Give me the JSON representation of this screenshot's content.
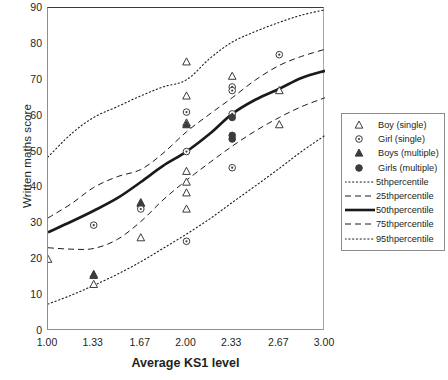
{
  "chart_data": {
    "type": "scatter",
    "title": "",
    "xlabel": "Average KS1 level",
    "ylabel": "Written maths score",
    "xlim": [
      1.0,
      3.0
    ],
    "ylim": [
      0,
      90
    ],
    "grid": false,
    "legend_position": "right",
    "xticks": [
      "1.00",
      "1.33",
      "1.67",
      "2.00",
      "2.33",
      "2.67",
      "3.00"
    ],
    "xtick_values": [
      1.0,
      1.33,
      1.67,
      2.0,
      2.33,
      2.67,
      3.0
    ],
    "yticks": [
      "0",
      "10",
      "20",
      "30",
      "40",
      "50",
      "60",
      "70",
      "80",
      "90"
    ],
    "ytick_values": [
      0,
      10,
      20,
      30,
      40,
      50,
      60,
      70,
      80,
      90
    ],
    "series": [
      {
        "name": "Boy (single)",
        "marker": "open-triangle",
        "points": [
          [
            1.0,
            20
          ],
          [
            1.33,
            15.5
          ],
          [
            1.33,
            13
          ],
          [
            1.67,
            35.5
          ],
          [
            1.67,
            26
          ],
          [
            2.0,
            75
          ],
          [
            2.0,
            65.5
          ],
          [
            2.0,
            58
          ],
          [
            2.0,
            44.5
          ],
          [
            2.0,
            41.5
          ],
          [
            2.0,
            38.5
          ],
          [
            2.0,
            34
          ],
          [
            2.33,
            71
          ],
          [
            2.67,
            67
          ],
          [
            2.67,
            57.5
          ]
        ]
      },
      {
        "name": "Girl (single)",
        "marker": "open-circle-dot",
        "points": [
          [
            1.33,
            29.5
          ],
          [
            1.67,
            34
          ],
          [
            2.0,
            61
          ],
          [
            2.0,
            50
          ],
          [
            2.0,
            25
          ],
          [
            2.33,
            68
          ],
          [
            2.33,
            67
          ],
          [
            2.33,
            60.5
          ],
          [
            2.33,
            45.5
          ],
          [
            2.67,
            77
          ]
        ]
      },
      {
        "name": "Boys (multiple)",
        "marker": "filled-triangle",
        "points": [
          [
            1.33,
            15.8
          ],
          [
            1.67,
            35.8
          ],
          [
            2.0,
            57.5
          ]
        ]
      },
      {
        "name": "Girls (multiple)",
        "marker": "filled-circle",
        "points": [
          [
            2.33,
            59.5
          ],
          [
            2.33,
            54.5
          ],
          [
            2.33,
            53.5
          ]
        ]
      }
    ],
    "percentile_curves": [
      {
        "name": "5thpercentile",
        "style": "dotted",
        "x": [
          1.0,
          1.17,
          1.33,
          1.5,
          1.67,
          1.83,
          2.0,
          2.17,
          2.33,
          2.5,
          2.67,
          2.83,
          3.0
        ],
        "y": [
          7.5,
          10.0,
          12.7,
          15.8,
          19.3,
          23.0,
          27.0,
          31.3,
          35.8,
          40.5,
          45.3,
          50.0,
          54.5
        ]
      },
      {
        "name": "25thpercentile",
        "style": "dashed",
        "x": [
          1.0,
          1.17,
          1.33,
          1.5,
          1.67,
          1.83,
          2.0,
          2.17,
          2.33,
          2.5,
          2.67,
          2.83,
          3.0
        ],
        "y": [
          23.2,
          22.8,
          23.0,
          25.5,
          30.5,
          36.5,
          42.0,
          47.0,
          51.5,
          55.8,
          59.5,
          62.5,
          65.0
        ]
      },
      {
        "name": "50thpercentile",
        "style": "solid",
        "x": [
          1.0,
          1.17,
          1.33,
          1.5,
          1.67,
          1.83,
          2.0,
          2.17,
          2.33,
          2.5,
          2.67,
          2.83,
          3.0
        ],
        "y": [
          27.5,
          30.5,
          33.5,
          37.0,
          41.5,
          46.0,
          50.0,
          55.0,
          60.5,
          64.5,
          67.5,
          70.5,
          72.5
        ]
      },
      {
        "name": "75thpercentile",
        "style": "dashed",
        "x": [
          1.0,
          1.17,
          1.33,
          1.5,
          1.67,
          1.83,
          2.0,
          2.17,
          2.33,
          2.5,
          2.67,
          2.83,
          3.0
        ],
        "y": [
          31.5,
          35.5,
          40.0,
          43.0,
          45.0,
          49.5,
          55.5,
          60.5,
          65.0,
          70.0,
          74.0,
          76.5,
          78.5
        ]
      },
      {
        "name": "95thpercentile",
        "style": "dotted",
        "x": [
          1.0,
          1.17,
          1.33,
          1.5,
          1.67,
          1.83,
          2.0,
          2.17,
          2.33,
          2.5,
          2.67,
          2.83,
          3.0
        ],
        "y": [
          48.5,
          55.0,
          59.5,
          62.5,
          65.5,
          68.0,
          70.0,
          76.0,
          80.5,
          83.5,
          86.0,
          88.0,
          89.5
        ]
      }
    ]
  },
  "axes": {
    "xlabel": "Average KS1 level",
    "ylabel": "Written maths score"
  },
  "legend": {
    "entries": [
      {
        "label": "Boy (single)",
        "key": "open-triangle",
        "kind": "marker"
      },
      {
        "label": "Girl (single)",
        "key": "open-circle-dot",
        "kind": "marker"
      },
      {
        "label": "Boys (multiple)",
        "key": "filled-triangle",
        "kind": "marker"
      },
      {
        "label": "Girls (multiple)",
        "key": "filled-circle",
        "kind": "marker"
      },
      {
        "label": "5thpercentile",
        "key": "dotted-line",
        "kind": "line"
      },
      {
        "label": "25thpercentile",
        "key": "dashed-line",
        "kind": "line"
      },
      {
        "label": "50thpercentile",
        "key": "solid-line",
        "kind": "line"
      },
      {
        "label": "75thpercentile",
        "key": "dashed-line",
        "kind": "line"
      },
      {
        "label": "95thpercentile",
        "key": "dotted-line",
        "kind": "line"
      }
    ]
  },
  "colors": {
    "ink": "#231f20",
    "frame": "#8e8e90",
    "curve": "#1a1a1a",
    "marker": "#3c3c3c"
  }
}
